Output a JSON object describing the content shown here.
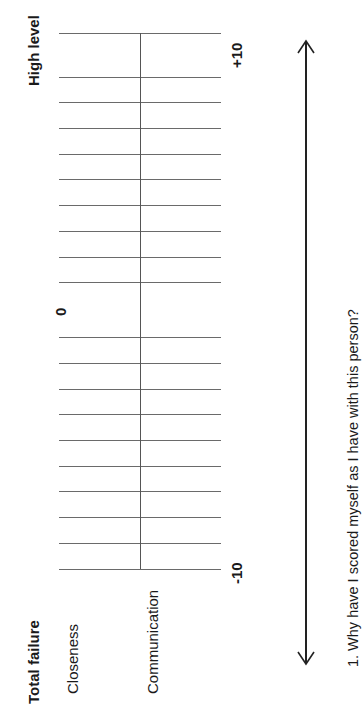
{
  "scale": {
    "top_label": "High level",
    "bottom_label": "Total failure",
    "max_label": "+10",
    "mid_label": "0",
    "min_label": "-10",
    "row_labels": [
      "Closeness",
      "Communication"
    ]
  },
  "question": "1. Why have I scored myself as I have with this person?"
}
